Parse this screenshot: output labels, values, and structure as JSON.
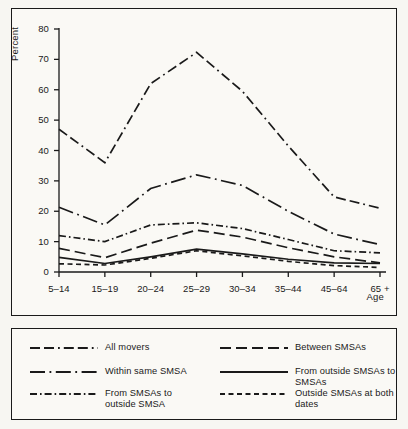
{
  "chart_data": {
    "type": "line",
    "title": "",
    "xlabel": "Age",
    "ylabel": "Percent",
    "ylim": [
      0,
      80
    ],
    "yticks": [
      0,
      10,
      20,
      30,
      40,
      50,
      60,
      70,
      80
    ],
    "grid": false,
    "legend_position": "below",
    "categories": [
      "5–14",
      "15–19",
      "20–24",
      "25–29",
      "30–34",
      "35–44",
      "45–64",
      "65 +"
    ],
    "series": [
      {
        "name": "All movers",
        "style": "dash-dash-dot",
        "values": [
          47.0,
          36.0,
          62.0,
          72.3,
          59.5,
          41.5,
          24.7,
          21.0
        ]
      },
      {
        "name": "Between SMSAs",
        "style": "long-dash",
        "values": [
          7.8,
          4.7,
          9.5,
          13.8,
          11.5,
          8.0,
          5.0,
          3.0
        ]
      },
      {
        "name": "Within same SMSA",
        "style": "long-dash-dot",
        "values": [
          21.3,
          15.5,
          27.5,
          32.0,
          28.5,
          20.0,
          12.5,
          9.0
        ]
      },
      {
        "name": "From outside SMSAs to SMSAs",
        "style": "solid",
        "values": [
          4.8,
          2.8,
          5.0,
          7.5,
          6.0,
          4.2,
          3.0,
          2.8
        ]
      },
      {
        "name": "From SMSAs to outside SMSA",
        "style": "dash-dot",
        "values": [
          12.0,
          10.0,
          15.5,
          16.2,
          14.3,
          10.7,
          7.0,
          6.3
        ]
      },
      {
        "name": "Outside SMSAs at both dates",
        "style": "short-dash",
        "values": [
          2.7,
          2.3,
          4.5,
          7.0,
          5.3,
          3.5,
          2.1,
          1.5
        ]
      }
    ]
  },
  "axes": {
    "y_title": "Percent",
    "x_title": "Age",
    "y_tick_labels": [
      "0",
      "10",
      "20",
      "30",
      "40",
      "50",
      "60",
      "70",
      "80"
    ],
    "x_tick_labels": [
      "5–14",
      "15–19",
      "20–24",
      "25–29",
      "30–34",
      "35–44",
      "45–64",
      "65 +"
    ]
  },
  "legend": {
    "entries": [
      {
        "label": "All movers",
        "style": "dash-dash-dot"
      },
      {
        "label": "Between SMSAs",
        "style": "long-dash"
      },
      {
        "label": "Within same SMSA",
        "style": "long-dash-dot"
      },
      {
        "label": "From outside SMSAs to SMSAs",
        "style": "solid"
      },
      {
        "label": "From SMSAs to\noutside SMSA",
        "style": "dash-dot"
      },
      {
        "label": "Outside SMSAs at both dates",
        "style": "short-dash"
      }
    ]
  },
  "colors": {
    "ink": "#1a1a1a",
    "page": "#f7f6f2",
    "panel": "#faf9f5"
  }
}
